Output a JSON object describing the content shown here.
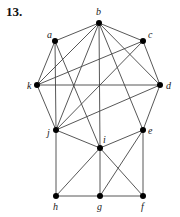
{
  "problem_number": "13.",
  "graph": {
    "vertices": [
      {
        "id": "a",
        "x": 55,
        "y": 41,
        "lx": 47,
        "ly": 38
      },
      {
        "id": "b",
        "x": 99,
        "y": 23,
        "lx": 96,
        "ly": 15
      },
      {
        "id": "c",
        "x": 143,
        "y": 41,
        "lx": 148,
        "ly": 38
      },
      {
        "id": "d",
        "x": 160,
        "y": 85,
        "lx": 166,
        "ly": 89
      },
      {
        "id": "e",
        "x": 143,
        "y": 130,
        "lx": 148,
        "ly": 134
      },
      {
        "id": "f",
        "x": 143,
        "y": 196,
        "lx": 141,
        "ly": 210
      },
      {
        "id": "g",
        "x": 100,
        "y": 196,
        "lx": 97,
        "ly": 210
      },
      {
        "id": "h",
        "x": 56,
        "y": 196,
        "lx": 53,
        "ly": 210
      },
      {
        "id": "i",
        "x": 100,
        "y": 148,
        "lx": 103,
        "ly": 143
      },
      {
        "id": "j",
        "x": 56,
        "y": 130,
        "lx": 47,
        "ly": 136
      },
      {
        "id": "k",
        "x": 37,
        "y": 85,
        "lx": 27,
        "ly": 89
      }
    ],
    "edges": [
      [
        "a",
        "b"
      ],
      [
        "a",
        "k"
      ],
      [
        "a",
        "j"
      ],
      [
        "a",
        "i"
      ],
      [
        "b",
        "c"
      ],
      [
        "b",
        "k"
      ],
      [
        "b",
        "j"
      ],
      [
        "b",
        "i"
      ],
      [
        "b",
        "e"
      ],
      [
        "b",
        "d"
      ],
      [
        "c",
        "k"
      ],
      [
        "c",
        "j"
      ],
      [
        "c",
        "d"
      ],
      [
        "k",
        "d"
      ],
      [
        "k",
        "j"
      ],
      [
        "d",
        "j"
      ],
      [
        "d",
        "e"
      ],
      [
        "j",
        "i"
      ],
      [
        "j",
        "h"
      ],
      [
        "i",
        "e"
      ],
      [
        "i",
        "h"
      ],
      [
        "i",
        "g"
      ],
      [
        "i",
        "f"
      ],
      [
        "e",
        "g"
      ],
      [
        "e",
        "f"
      ],
      [
        "h",
        "g"
      ],
      [
        "g",
        "f"
      ]
    ]
  }
}
